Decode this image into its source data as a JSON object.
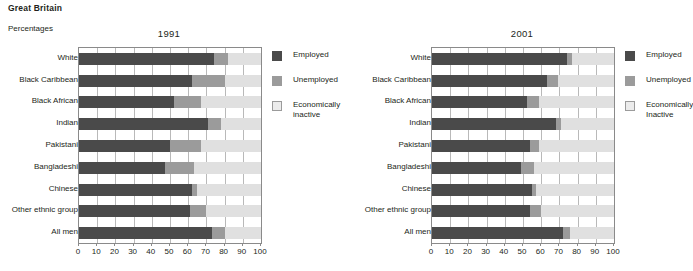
{
  "header": {
    "title": "Great Britain",
    "subtitle": "Percentages"
  },
  "legend": {
    "employed": "Employed",
    "unemployed": "Unemployed",
    "inactive_1991": "Economically\ninactive",
    "inactive_2001": "Economically\nInactive"
  },
  "axis": {
    "ticks": [
      "0",
      "10",
      "20",
      "30",
      "40",
      "50",
      "60",
      "70",
      "80",
      "90",
      "100"
    ]
  },
  "colors": {
    "employed": "#4a4a4a",
    "unemployed": "#9b9b9b",
    "inactive": "#e0e0e0",
    "grid": "#b9b9b9",
    "axis": "#8a8a8a",
    "text": "#231f20"
  },
  "panels": [
    {
      "title": "1991"
    },
    {
      "title": "2001"
    }
  ],
  "chart_data": [
    {
      "type": "bar",
      "orientation": "horizontal",
      "stacked": true,
      "title": "1991",
      "xlabel": "",
      "ylabel": "",
      "xlim": [
        0,
        100
      ],
      "xticks": [
        0,
        10,
        20,
        30,
        40,
        50,
        60,
        70,
        80,
        90,
        100
      ],
      "grid": true,
      "legend_position": "right",
      "categories": [
        "White",
        "Black Caribbean",
        "Black African",
        "Indian",
        "Pakistani",
        "Bangladeshi",
        "Chinese",
        "Other ethnic group",
        "All men"
      ],
      "series": [
        {
          "name": "Employed",
          "values": [
            74,
            62,
            52,
            71,
            50,
            47,
            62,
            61,
            73
          ]
        },
        {
          "name": "Unemployed",
          "values": [
            8,
            18,
            15,
            7,
            17,
            16,
            3,
            9,
            7
          ]
        },
        {
          "name": "Economically inactive",
          "values": [
            18,
            20,
            33,
            22,
            33,
            37,
            35,
            30,
            20
          ]
        }
      ]
    },
    {
      "type": "bar",
      "orientation": "horizontal",
      "stacked": true,
      "title": "2001",
      "xlabel": "",
      "ylabel": "",
      "xlim": [
        0,
        100
      ],
      "xticks": [
        0,
        10,
        20,
        30,
        40,
        50,
        60,
        70,
        80,
        90,
        100
      ],
      "grid": true,
      "legend_position": "right",
      "categories": [
        "White",
        "Black Caribbean",
        "Black African",
        "Indian",
        "Pakistani",
        "Bangladeshi",
        "Chinese",
        "Other ethnic group",
        "All men"
      ],
      "series": [
        {
          "name": "Employed",
          "values": [
            74,
            63,
            52,
            68,
            54,
            49,
            55,
            54,
            72
          ]
        },
        {
          "name": "Unemployed",
          "values": [
            3,
            6,
            7,
            3,
            5,
            7,
            2,
            6,
            4
          ]
        },
        {
          "name": "Economically Inactive",
          "values": [
            23,
            31,
            41,
            29,
            41,
            44,
            43,
            40,
            24
          ]
        }
      ]
    }
  ]
}
